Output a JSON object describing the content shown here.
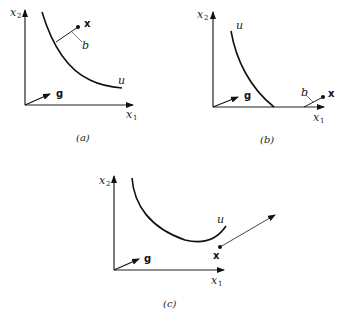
{
  "panels": [
    {
      "id": "a",
      "caption": "(a)",
      "axis_x_label": "x",
      "axis_x_sub": "1",
      "axis_y_label": "x",
      "axis_y_sub": "2",
      "vector_label": "g",
      "curve_label": "u",
      "point_label": "x",
      "segment_label": "b"
    },
    {
      "id": "b",
      "caption": "(b)",
      "axis_x_label": "x",
      "axis_x_sub": "1",
      "axis_y_label": "x",
      "axis_y_sub": "2",
      "vector_label": "g",
      "curve_label": "u",
      "point_label": "x",
      "segment_label": "b"
    },
    {
      "id": "c",
      "caption": "(c)",
      "axis_x_label": "x",
      "axis_x_sub": "1",
      "axis_y_label": "x",
      "axis_y_sub": "2",
      "vector_label": "g",
      "curve_label": "u",
      "point_label": "x"
    }
  ]
}
